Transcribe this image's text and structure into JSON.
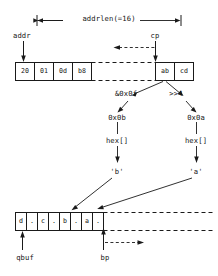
{
  "diagram": {
    "title_label": "addrlen(=16)",
    "pointers": {
      "addr": "addr",
      "cp": "cp",
      "qbuf": "qbuf",
      "bp": "bp"
    },
    "addr_buffer": {
      "name": "addr-byte-buffer",
      "left_bytes": [
        "20",
        "01",
        "0d",
        "b8"
      ],
      "gap": "",
      "right_bytes": [
        "ab",
        "cd"
      ]
    },
    "operations": [
      {
        "name": "mask-low-nibble",
        "label": "&0x0f",
        "result": "0x0b",
        "lookup": "hex[]",
        "char": "'b'"
      },
      {
        "name": "shift-high-nibble",
        "label": ">>4",
        "result": "0x0a",
        "lookup": "hex[]",
        "char": "'a'"
      }
    ],
    "qbuf_cells": [
      "d",
      ".",
      "c",
      ".",
      "b",
      ".",
      "a",
      "."
    ],
    "colors": {
      "stroke": "#1a1a1a",
      "background": "#ffffff",
      "dashed": "#555555"
    }
  }
}
